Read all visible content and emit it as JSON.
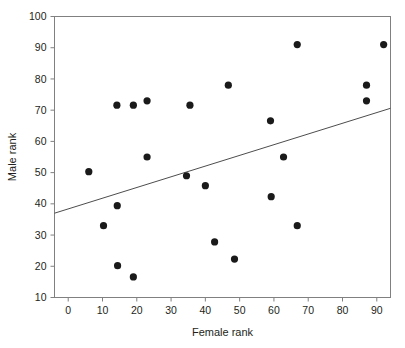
{
  "chart_data": {
    "type": "scatter",
    "title": "",
    "xlabel": "Female rank",
    "ylabel": "Male rank",
    "xlim": [
      -4,
      94
    ],
    "ylim": [
      10,
      100
    ],
    "xticks": [
      0,
      10,
      20,
      30,
      40,
      50,
      60,
      70,
      80,
      90
    ],
    "yticks": [
      10,
      20,
      30,
      40,
      50,
      60,
      70,
      80,
      90,
      100
    ],
    "xtick_labels": [
      "0",
      "10",
      "20",
      "30",
      "40",
      "50",
      "60",
      "70",
      "80",
      "90"
    ],
    "ytick_labels": [
      "10",
      "20",
      "30",
      "40",
      "50",
      "60",
      "70",
      "80",
      "90",
      "100"
    ],
    "grid": false,
    "legend": false,
    "marker": "filled-circle",
    "marker_color": "#1a1a1a",
    "marker_size": 6,
    "axis_color": "#808080",
    "points": [
      {
        "x": 6.0,
        "y": 50.3
      },
      {
        "x": 10.3,
        "y": 33.0
      },
      {
        "x": 14.2,
        "y": 71.6
      },
      {
        "x": 14.3,
        "y": 39.4
      },
      {
        "x": 14.4,
        "y": 20.2
      },
      {
        "x": 19.0,
        "y": 71.6
      },
      {
        "x": 19.0,
        "y": 16.6
      },
      {
        "x": 23.0,
        "y": 73.0
      },
      {
        "x": 23.0,
        "y": 55.0
      },
      {
        "x": 34.5,
        "y": 49.0
      },
      {
        "x": 35.5,
        "y": 71.6
      },
      {
        "x": 40.0,
        "y": 45.8
      },
      {
        "x": 42.7,
        "y": 27.8
      },
      {
        "x": 46.7,
        "y": 78.0
      },
      {
        "x": 48.5,
        "y": 22.3
      },
      {
        "x": 59.0,
        "y": 66.6
      },
      {
        "x": 59.2,
        "y": 42.3
      },
      {
        "x": 62.8,
        "y": 55.0
      },
      {
        "x": 66.8,
        "y": 91.0
      },
      {
        "x": 66.8,
        "y": 33.0
      },
      {
        "x": 87.0,
        "y": 78.0
      },
      {
        "x": 87.0,
        "y": 73.0
      },
      {
        "x": 92.0,
        "y": 91.0
      }
    ],
    "trendline": {
      "label": "regression line",
      "x_start": -4,
      "y_start": 37.0,
      "x_end": 94,
      "y_end": 70.6,
      "color": "#4d4d4d"
    }
  }
}
